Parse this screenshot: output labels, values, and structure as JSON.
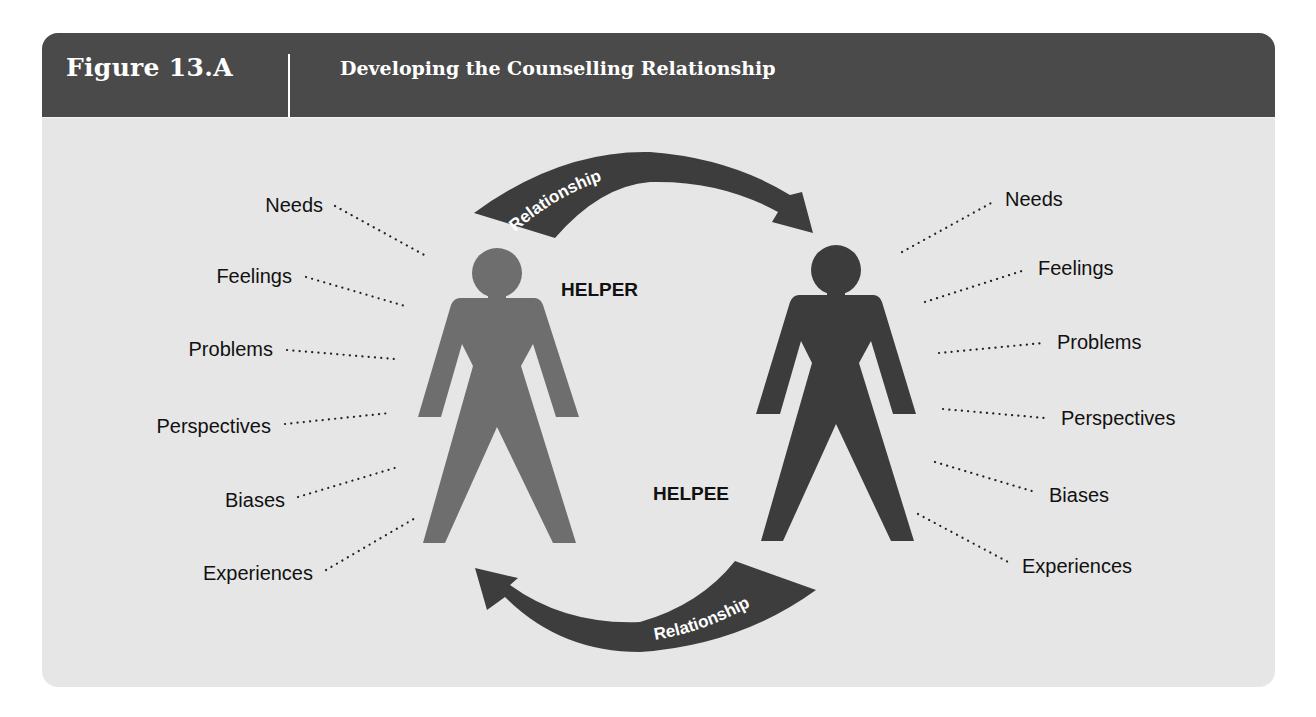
{
  "header": {
    "figure_number": "Figure 13.A",
    "title": "Developing the Counselling Relationship"
  },
  "figures": {
    "helper": {
      "label": "HELPER",
      "color": "#6e6e6e"
    },
    "helpee": {
      "label": "HELPEE",
      "color": "#3c3c3c"
    }
  },
  "arrows": {
    "top": {
      "label": "Relationship",
      "direction": "helper-to-helpee"
    },
    "bottom": {
      "label": "Relationship",
      "direction": "helpee-to-helper"
    }
  },
  "helper_attributes": [
    "Needs",
    "Feelings",
    "Problems",
    "Perspectives",
    "Biases",
    "Experiences"
  ],
  "helpee_attributes": [
    "Needs",
    "Feelings",
    "Problems",
    "Perspectives",
    "Biases",
    "Experiences"
  ],
  "colors": {
    "header_bg": "#4a4a4a",
    "panel_bg": "#e6e6e6",
    "arrow": "#3d3d3d"
  }
}
